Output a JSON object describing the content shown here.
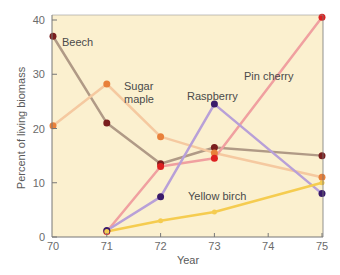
{
  "chart_data": {
    "type": "line",
    "title": "",
    "xlabel": "Year",
    "ylabel": "Percent of living biomass",
    "x": [
      70,
      71,
      72,
      73,
      74,
      75
    ],
    "xticks": [
      "70",
      "71",
      "72",
      "73",
      "74",
      "75"
    ],
    "yticks": [
      "0",
      "10",
      "20",
      "30",
      "40"
    ],
    "xlim": [
      70,
      75
    ],
    "ylim": [
      0,
      40
    ],
    "grid": false,
    "legend": "inline labels",
    "plot_background": "#fbf0cf",
    "series": [
      {
        "name": "Beech",
        "color": "#b09a86",
        "marker": "#7a1e1e",
        "x": [
          70,
          71,
          72,
          73,
          75
        ],
        "values": [
          37,
          21,
          13.5,
          16.5,
          15
        ],
        "label_pos": [
          62,
          46
        ]
      },
      {
        "name": "Sugar maple",
        "label_lines": [
          "Sugar",
          "maple"
        ],
        "color": "#f5c9a0",
        "marker": "#e8803a",
        "x": [
          70,
          71,
          72,
          73,
          75
        ],
        "values": [
          20.5,
          28.2,
          18.5,
          15.5,
          11
        ],
        "label_pos": [
          124,
          90
        ]
      },
      {
        "name": "Pin cherry",
        "color": "#f0a0a0",
        "marker": "#dd2020",
        "x": [
          71,
          72,
          73,
          75
        ],
        "values": [
          1,
          13,
          14.5,
          40.5
        ],
        "label_pos": [
          244,
          80
        ]
      },
      {
        "name": "Raspberry",
        "color": "#b8a0d8",
        "marker": "#3a1a6a",
        "x": [
          71,
          72,
          73,
          75
        ],
        "values": [
          1.2,
          7.4,
          24.5,
          8
        ],
        "label_pos": [
          187,
          100
        ]
      },
      {
        "name": "Yellow birch",
        "color": "#f5cc50",
        "marker": "#f5cc50",
        "x": [
          71,
          72,
          73,
          75
        ],
        "values": [
          1,
          3,
          4.6,
          10
        ],
        "label_pos": [
          188,
          200
        ]
      }
    ]
  }
}
